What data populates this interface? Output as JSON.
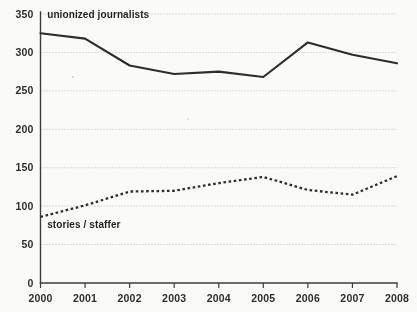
{
  "chart_data": {
    "type": "line",
    "title": "",
    "xlabel": "",
    "ylabel": "",
    "grid": true,
    "legend_position": "inline-annotation",
    "categories": [
      "2000",
      "2001",
      "2002",
      "2003",
      "2004",
      "2005",
      "2006",
      "2007",
      "2008"
    ],
    "x": [
      2000,
      2001,
      2002,
      2003,
      2004,
      2005,
      2006,
      2007,
      2008
    ],
    "xlim": [
      2000,
      2008
    ],
    "ylim": [
      0,
      350
    ],
    "ytick_labels": [
      "0",
      "50",
      "100",
      "150",
      "200",
      "250",
      "300",
      "350"
    ],
    "yticks": [
      0,
      50,
      100,
      150,
      200,
      250,
      300,
      350
    ],
    "series": [
      {
        "name": "unionized journalists",
        "style": "solid",
        "color": "#2a2a2a",
        "values": [
          325,
          318,
          283,
          272,
          275,
          268,
          313,
          297,
          286
        ]
      },
      {
        "name": "stories / staffer",
        "style": "dotted",
        "color": "#2a2a2a",
        "values": [
          86,
          101,
          119,
          120,
          130,
          138,
          121,
          115,
          139
        ]
      }
    ],
    "annotations": [
      {
        "text": "unionized journalists",
        "x": 2000.15,
        "y": 345
      },
      {
        "text": "stories / staffer",
        "x": 2000.15,
        "y": 72
      }
    ]
  }
}
